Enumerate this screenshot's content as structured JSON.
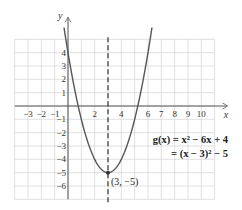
{
  "chart_data": {
    "type": "line",
    "title": "",
    "xlabel": "x",
    "ylabel": "y",
    "xlim": [
      -4,
      11
    ],
    "ylim": [
      -7,
      5
    ],
    "grid": true,
    "x_ticks": [
      "-3",
      "-2",
      "-1",
      "2",
      "4",
      "6",
      "7",
      "8",
      "9",
      "10"
    ],
    "y_ticks": [
      "4",
      "3",
      "2",
      "1",
      "-1",
      "-2",
      "-3",
      "-4",
      "-5",
      "-6"
    ],
    "series": [
      {
        "name": "g(x) = x^2 - 6x + 4",
        "function": "x^2 - 6x + 4",
        "x": [
          -0.3,
          0,
          1,
          2,
          3,
          4,
          5,
          6,
          6.3
        ],
        "values": [
          5.89,
          4,
          -1,
          -4,
          -5,
          -4,
          -1,
          4,
          5.89
        ]
      }
    ],
    "vertex": {
      "x": 3,
      "y": -5,
      "label": "(3, −5)"
    },
    "axis_of_symmetry": {
      "x": 3,
      "style": "dashed"
    },
    "annotations": [
      "g(x) = x² − 6x + 4",
      "= (x − 3)² − 5"
    ]
  },
  "labels": {
    "x_axis": "x",
    "y_axis": "y",
    "eq_line1": "g(x) = x² − 6x + 4",
    "eq_line2": "= (x − 3)² − 5",
    "vertex": "(3, −5)"
  },
  "colors": {
    "grid": "#d8d8d8",
    "axis": "#555555",
    "curve": "#555555",
    "dashed": "#333333"
  }
}
